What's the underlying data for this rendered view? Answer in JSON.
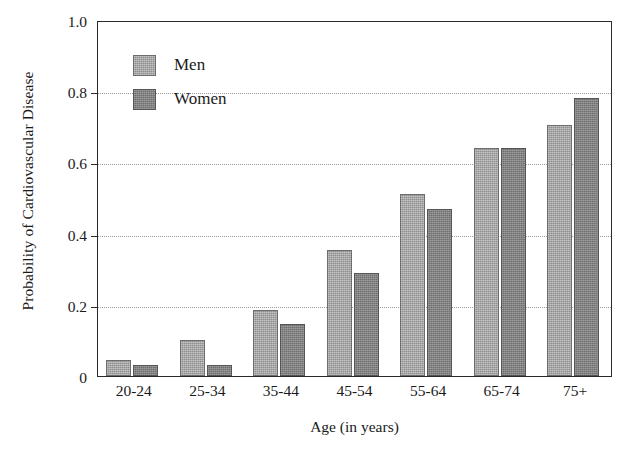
{
  "chart_data": {
    "type": "bar",
    "title": "",
    "xlabel": "Age (in years)",
    "ylabel": "Probability of Cardiovascular Disease",
    "categories": [
      "20-24",
      "25-34",
      "35-44",
      "45-54",
      "55-64",
      "65-74",
      "75+"
    ],
    "series": [
      {
        "name": "Men",
        "values": [
          0.045,
          0.1,
          0.185,
          0.355,
          0.51,
          0.64,
          0.705
        ],
        "color": "#8e8e8e"
      },
      {
        "name": "Women",
        "values": [
          0.03,
          0.03,
          0.147,
          0.29,
          0.47,
          0.64,
          0.78
        ],
        "color": "#6e6e6e"
      }
    ],
    "ylim": [
      0,
      1.0
    ],
    "ytick_labels": [
      "1.0",
      "0.8",
      "0.6",
      "0.4",
      "0.2",
      "0"
    ],
    "ytick_values": [
      1.0,
      0.8,
      0.6,
      0.4,
      0.2,
      0
    ],
    "gridlines_at": [
      0.8,
      0.6,
      0.4,
      0.2
    ],
    "grid": true,
    "legend_position": "upper left"
  },
  "legend": {
    "entries": [
      {
        "label": "Men"
      },
      {
        "label": "Women"
      }
    ]
  }
}
